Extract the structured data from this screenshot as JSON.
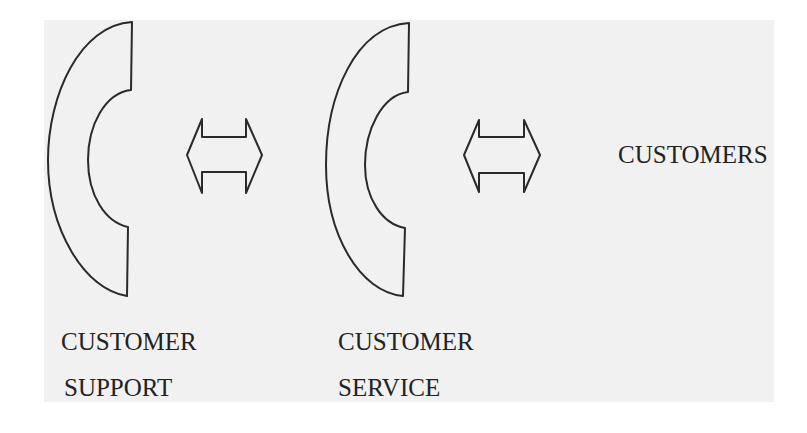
{
  "diagram": {
    "title": "",
    "nodes": [
      {
        "id": "customer-support",
        "icon": "telephone-handset-icon",
        "label_lines": [
          "CUSTOMER",
          "SUPPORT"
        ]
      },
      {
        "id": "customer-service",
        "icon": "telephone-handset-icon",
        "label_lines": [
          "CUSTOMER",
          "SERVICE"
        ]
      },
      {
        "id": "customers",
        "label_lines": [
          "CUSTOMERS"
        ]
      }
    ],
    "edges": [
      {
        "from": "customer-support",
        "to": "customer-service",
        "type": "bidirectional-arrow"
      },
      {
        "from": "customer-service",
        "to": "customers",
        "type": "bidirectional-arrow"
      }
    ]
  },
  "colors": {
    "background": "#ffffff",
    "panel": "#f1f1f1",
    "stroke": "#2a2a2a",
    "text": "#222222"
  }
}
